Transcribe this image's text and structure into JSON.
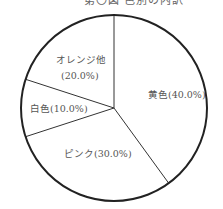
{
  "chart_data": {
    "type": "pie",
    "title": "第〇図 色別の内訳",
    "title_clipped": true,
    "start_angle_deg": 0,
    "direction": "clockwise",
    "categories": [
      "黄色",
      "ピンク",
      "白色",
      "オレンジ他"
    ],
    "values": [
      40.0,
      30.0,
      10.0,
      20.0
    ],
    "labels": [
      "黄色(40.0%)",
      "ピンク(30.0%)",
      "白色(10.0%)",
      "オレンジ他 (20.0%)"
    ],
    "fill": "#ffffff",
    "stroke": "#222222",
    "legend": "none"
  },
  "labels": {
    "yellow": "黄色(40.0%)",
    "pink": "ピンク(30.0%)",
    "white": "白色(10.0%)",
    "orange_line1": "オレンジ他",
    "orange_line2": "(20.0%)"
  }
}
